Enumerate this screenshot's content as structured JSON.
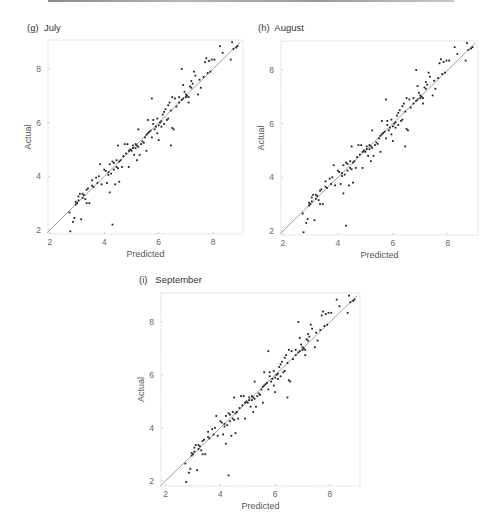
{
  "page": {
    "top_rule": true
  },
  "chart_data": [
    {
      "id": "july",
      "type": "scatter",
      "title": "(g)  July",
      "xlabel": "Predicted",
      "ylabel": "Actual",
      "xticks": [
        2,
        4,
        6,
        8
      ],
      "yticks": [
        2,
        4,
        6,
        8
      ],
      "xlim": [
        1.93,
        9.1
      ],
      "ylim": [
        1.85,
        9.08
      ],
      "reference_line": {
        "x": [
          1.9,
          9.0
        ],
        "y": [
          1.9,
          9.0
        ],
        "color": "#a0a0a0"
      },
      "grid": false,
      "frame": {
        "left": 48,
        "top": 40,
        "width": 195,
        "height": 194
      },
      "title_pos": {
        "left": 27,
        "top": 22
      },
      "point_color": "#222222"
    },
    {
      "id": "august",
      "type": "scatter",
      "title": "(h)  August",
      "xlabel": "Predicted",
      "ylabel": "Actual",
      "xticks": [
        2,
        4,
        6,
        8
      ],
      "yticks": [
        2,
        4,
        6,
        8
      ],
      "xlim": [
        1.93,
        9.1
      ],
      "ylim": [
        1.85,
        9.08
      ],
      "reference_line": {
        "x": [
          1.9,
          9.0
        ],
        "y": [
          1.9,
          9.0
        ],
        "color": "#a0a0a0"
      },
      "grid": false,
      "frame": {
        "left": 281,
        "top": 41,
        "width": 197,
        "height": 194
      },
      "title_pos": {
        "left": 258,
        "top": 22
      },
      "point_color": "#222222"
    },
    {
      "id": "september",
      "type": "scatter",
      "title": "(i)   September",
      "xlabel": "Predicted",
      "ylabel": "Actual",
      "xticks": [
        2,
        4,
        6,
        8
      ],
      "yticks": [
        2,
        4,
        6,
        8
      ],
      "xlim": [
        1.83,
        9.1
      ],
      "ylim": [
        1.8,
        9.1
      ],
      "reference_line": {
        "x": [
          1.8,
          9.0
        ],
        "y": [
          1.8,
          9.0
        ],
        "color": "#a0a0a0"
      },
      "grid": false,
      "frame": {
        "left": 161,
        "top": 293,
        "width": 199,
        "height": 193
      },
      "title_pos": {
        "left": 139,
        "top": 274
      },
      "point_color": "#222222"
    }
  ],
  "points": [
    [
      2.72,
      2.65
    ],
    [
      2.75,
      1.95
    ],
    [
      2.85,
      2.3
    ],
    [
      2.9,
      2.45
    ],
    [
      2.95,
      2.95
    ],
    [
      3.0,
      3.0
    ],
    [
      3.05,
      3.1
    ],
    [
      3.05,
      3.25
    ],
    [
      3.1,
      3.35
    ],
    [
      3.15,
      2.4
    ],
    [
      3.2,
      3.2
    ],
    [
      3.25,
      3.3
    ],
    [
      3.3,
      3.15
    ],
    [
      3.35,
      3.0
    ],
    [
      3.4,
      3.55
    ],
    [
      3.45,
      3.0
    ],
    [
      3.55,
      3.85
    ],
    [
      3.6,
      3.6
    ],
    [
      3.7,
      3.95
    ],
    [
      3.75,
      3.75
    ],
    [
      3.8,
      4.0
    ],
    [
      3.85,
      4.45
    ],
    [
      3.9,
      3.7
    ],
    [
      4.05,
      4.2
    ],
    [
      4.1,
      3.75
    ],
    [
      4.15,
      4.05
    ],
    [
      4.2,
      4.45
    ],
    [
      4.2,
      3.4
    ],
    [
      4.25,
      4.1
    ],
    [
      4.3,
      2.2
    ],
    [
      4.3,
      4.55
    ],
    [
      4.35,
      4.5
    ],
    [
      4.4,
      3.7
    ],
    [
      4.45,
      4.35
    ],
    [
      4.5,
      4.3
    ],
    [
      4.5,
      5.15
    ],
    [
      4.55,
      3.8
    ],
    [
      4.6,
      4.6
    ],
    [
      4.65,
      4.35
    ],
    [
      4.7,
      4.75
    ],
    [
      4.75,
      5.2
    ],
    [
      4.8,
      4.85
    ],
    [
      4.85,
      5.2
    ],
    [
      4.9,
      4.35
    ],
    [
      4.9,
      4.95
    ],
    [
      4.95,
      5.0
    ],
    [
      5.0,
      4.95
    ],
    [
      5.05,
      5.05
    ],
    [
      5.1,
      4.8
    ],
    [
      5.15,
      5.05
    ],
    [
      5.2,
      5.15
    ],
    [
      5.2,
      4.6
    ],
    [
      5.25,
      5.1
    ],
    [
      5.25,
      5.75
    ],
    [
      5.3,
      4.8
    ],
    [
      5.35,
      5.2
    ],
    [
      5.45,
      5.25
    ],
    [
      5.5,
      5.45
    ],
    [
      5.55,
      4.95
    ],
    [
      5.55,
      5.55
    ],
    [
      5.6,
      6.1
    ],
    [
      5.65,
      5.65
    ],
    [
      5.7,
      5.7
    ],
    [
      5.75,
      5.45
    ],
    [
      5.75,
      6.9
    ],
    [
      5.8,
      5.95
    ],
    [
      5.8,
      6.1
    ],
    [
      5.85,
      5.75
    ],
    [
      5.95,
      5.6
    ],
    [
      5.95,
      6.15
    ],
    [
      6.0,
      5.35
    ],
    [
      6.0,
      5.9
    ],
    [
      6.05,
      6.0
    ],
    [
      6.1,
      5.85
    ],
    [
      6.15,
      6.3
    ],
    [
      6.2,
      6.4
    ],
    [
      6.2,
      5.95
    ],
    [
      6.25,
      6.5
    ],
    [
      6.35,
      6.15
    ],
    [
      6.35,
      6.65
    ],
    [
      6.4,
      6.75
    ],
    [
      6.45,
      5.15
    ],
    [
      6.5,
      6.95
    ],
    [
      6.5,
      5.8
    ],
    [
      6.55,
      5.75
    ],
    [
      6.6,
      6.9
    ],
    [
      6.65,
      6.6
    ],
    [
      6.75,
      6.75
    ],
    [
      6.85,
      6.85
    ],
    [
      6.85,
      8.0
    ],
    [
      6.9,
      6.9
    ],
    [
      6.9,
      7.4
    ],
    [
      6.95,
      7.15
    ],
    [
      7.0,
      7.05
    ],
    [
      7.05,
      7.0
    ],
    [
      7.1,
      6.95
    ],
    [
      7.1,
      6.75
    ],
    [
      7.2,
      7.3
    ],
    [
      7.2,
      7.55
    ],
    [
      7.25,
      7.45
    ],
    [
      7.3,
      7.9
    ],
    [
      7.35,
      7.75
    ],
    [
      7.45,
      7.05
    ],
    [
      7.55,
      7.3
    ],
    [
      7.65,
      7.7
    ],
    [
      7.7,
      8.25
    ],
    [
      7.75,
      8.4
    ],
    [
      7.8,
      7.85
    ],
    [
      7.85,
      8.3
    ],
    [
      7.9,
      7.9
    ],
    [
      7.95,
      8.35
    ],
    [
      8.05,
      8.35
    ],
    [
      8.25,
      8.85
    ],
    [
      8.35,
      8.6
    ],
    [
      8.65,
      8.35
    ],
    [
      8.7,
      9.0
    ],
    [
      8.75,
      8.75
    ],
    [
      8.85,
      8.8
    ],
    [
      8.9,
      8.85
    ],
    [
      3.55,
      3.65
    ],
    [
      4.15,
      4.15
    ],
    [
      5.15,
      5.2
    ],
    [
      6.1,
      6.05
    ],
    [
      3.2,
      3.35
    ],
    [
      4.55,
      4.55
    ],
    [
      5.05,
      5.15
    ],
    [
      6.45,
      6.45
    ],
    [
      7.15,
      7.35
    ],
    [
      2.95,
      3.05
    ],
    [
      5.6,
      5.6
    ],
    [
      4.35,
      4.25
    ],
    [
      4.45,
      4.6
    ],
    [
      5.4,
      5.3
    ],
    [
      6.75,
      6.95
    ],
    [
      7.5,
      7.6
    ],
    [
      3.35,
      3.5
    ],
    [
      4.0,
      4.25
    ],
    [
      6.3,
      6.1
    ],
    [
      5.9,
      5.85
    ],
    [
      7.0,
      6.95
    ]
  ],
  "point_offsets": {
    "july": [
      0.0,
      0.0
    ],
    "august": [
      0.0,
      0.0
    ],
    "september": [
      0.0,
      0.0
    ]
  }
}
